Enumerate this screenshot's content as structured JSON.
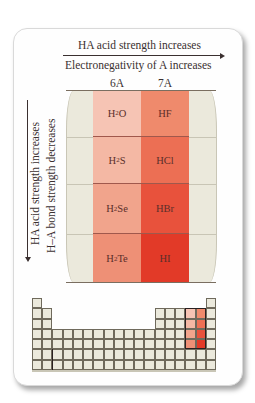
{
  "header": {
    "acid_strength_label": "HA acid strength increases",
    "electronegativity_label": "Electronegativity of A increases"
  },
  "groups": [
    {
      "label": "6A",
      "color_hint": "light-red"
    },
    {
      "label": "7A",
      "color_hint": "dark-red"
    }
  ],
  "left_labels": {
    "acid_strength_label": "HA acid strength increases",
    "bond_strength_label": "H–A bond strength decreases"
  },
  "rows": [
    {
      "g6_base": "H",
      "g6_sub": "2",
      "g6_rest": "O",
      "g6_color": "#f6c4b4",
      "g7": "HF",
      "g7_color": "#ef8a6c"
    },
    {
      "g6_base": "H",
      "g6_sub": "2",
      "g6_rest": "S",
      "g6_color": "#f4b8a4",
      "g7": "HCl",
      "g7_color": "#ec6f54"
    },
    {
      "g6_base": "H",
      "g6_sub": "2",
      "g6_rest": "Se",
      "g6_color": "#f1a48c",
      "g7": "HBr",
      "g7_color": "#e8523c"
    },
    {
      "g6_base": "H",
      "g6_sub": "2",
      "g6_rest": "Te",
      "g6_color": "#ee9076",
      "g7": "HI",
      "g7_color": "#e23a28"
    }
  ],
  "periodic_table": {
    "columns": 18,
    "rows": 7,
    "highlighted_columns": [
      "6A",
      "7A"
    ],
    "highlighted_rows": [
      2,
      3,
      4,
      5
    ]
  }
}
